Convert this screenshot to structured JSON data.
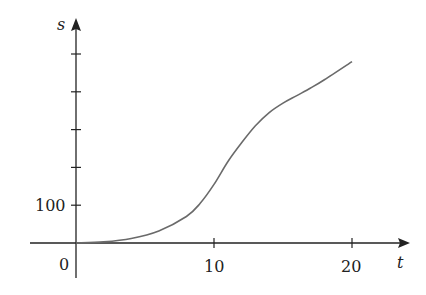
{
  "chart_data": {
    "type": "line",
    "title": "",
    "xlabel": "t",
    "ylabel": "s",
    "xlim": [
      0,
      20
    ],
    "ylim": [
      0,
      500
    ],
    "x_ticks": [
      10,
      20
    ],
    "x_tick_labels": [
      "10",
      "20"
    ],
    "y_ticks": [
      100,
      200,
      300,
      400,
      500
    ],
    "y_tick_labels": [
      "100"
    ],
    "origin_label": "0",
    "grid": false,
    "legend": null,
    "series": [
      {
        "name": "s(t)",
        "color": "#6a6a6a",
        "x": [
          0,
          2,
          4,
          6,
          8,
          9,
          10,
          11,
          12,
          13,
          14,
          15,
          16,
          17,
          18,
          20
        ],
        "values": [
          0,
          3,
          12,
          32,
          70,
          105,
          155,
          215,
          265,
          310,
          345,
          370,
          390,
          410,
          432,
          480
        ]
      }
    ]
  },
  "labels": {
    "x_axis": "t",
    "y_axis": "s",
    "origin": "0",
    "y_100": "100",
    "x_10": "10",
    "x_20": "20"
  }
}
